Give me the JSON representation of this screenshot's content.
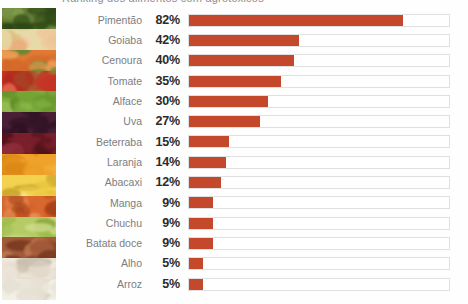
{
  "header": {
    "clipped_title": "Ranking dos alimentos com agrotóxicos"
  },
  "chart_data": {
    "type": "bar",
    "orientation": "horizontal",
    "title": "",
    "xlabel": "",
    "ylabel": "",
    "xlim": [
      0,
      100
    ],
    "grid": false,
    "legend": false,
    "value_suffix": "%",
    "bar_color": "#c4492c",
    "track_color": "#ffffff",
    "track_border_color": "#e0e0e0",
    "label_color": "#7d7d7d",
    "value_color": "#2b2b2b",
    "categories": [
      "Pimentão",
      "Goiaba",
      "Cenoura",
      "Tomate",
      "Alface",
      "Uva",
      "Beterraba",
      "Laranja",
      "Abacaxi",
      "Manga",
      "Chuchu",
      "Batata doce",
      "Alho",
      "Arroz"
    ],
    "values": [
      82,
      42,
      40,
      35,
      30,
      27,
      15,
      14,
      12,
      9,
      9,
      9,
      5,
      5
    ],
    "value_labels": [
      "82%",
      "42%",
      "40%",
      "35%",
      "30%",
      "27%",
      "15%",
      "14%",
      "12%",
      "9%",
      "9%",
      "9%",
      "5%",
      "5%"
    ]
  },
  "photo_strip": {
    "name": "food-collage-strip",
    "bands": [
      {
        "item": "pimentao",
        "colors": [
          "#3f5b1f",
          "#2e4716",
          "#6f8a3a",
          "#86a04f"
        ]
      },
      {
        "item": "goiaba",
        "colors": [
          "#e8d9a8",
          "#d9c37f",
          "#e9a878",
          "#f0c79a"
        ]
      },
      {
        "item": "cenoura",
        "colors": [
          "#e07a33",
          "#d4682a",
          "#eda055",
          "#5f8a34"
        ]
      },
      {
        "item": "tomate",
        "colors": [
          "#c63526",
          "#b22a1d",
          "#e06a4e",
          "#7fa542"
        ]
      },
      {
        "item": "alface",
        "colors": [
          "#7fae3c",
          "#6a9a2e",
          "#a3c85f",
          "#5d8a28"
        ]
      },
      {
        "item": "uva",
        "colors": [
          "#4a2036",
          "#331426",
          "#6d3352",
          "#2a0f1f"
        ]
      },
      {
        "item": "beterraba",
        "colors": [
          "#7a1f2b",
          "#5e1620",
          "#9c3344",
          "#4a1018"
        ]
      },
      {
        "item": "laranja",
        "colors": [
          "#f0a32b",
          "#e3901c",
          "#f7c15c",
          "#d98412"
        ]
      },
      {
        "item": "abacaxi",
        "colors": [
          "#f2d24e",
          "#e8c23a",
          "#f7e186",
          "#c9a52a"
        ]
      },
      {
        "item": "manga",
        "colors": [
          "#d9682f",
          "#c5541f",
          "#e8965a",
          "#a33f18"
        ]
      },
      {
        "item": "chuchu",
        "colors": [
          "#b5cc66",
          "#9dbb4c",
          "#cfdd8e",
          "#8aa83c"
        ]
      },
      {
        "item": "batata-doce",
        "colors": [
          "#a35a3a",
          "#8c472b",
          "#bf7a54",
          "#73351c"
        ]
      },
      {
        "item": "alho",
        "colors": [
          "#ece4d8",
          "#dcd2c2",
          "#f5f0e8",
          "#cabfae"
        ]
      },
      {
        "item": "arroz",
        "colors": [
          "#f3efe6",
          "#e7e1d4",
          "#fbf8f2",
          "#d9d2c4"
        ]
      }
    ]
  }
}
